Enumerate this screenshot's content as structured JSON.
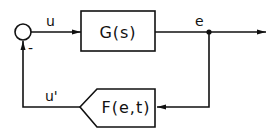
{
  "diagram": {
    "type": "feedback-control-block-diagram",
    "summing_junction": {
      "sign": "-"
    },
    "forward_block": {
      "label": "G(s)"
    },
    "feedback_block": {
      "label": "F(e,t)"
    },
    "signals": {
      "input_to_plant": "u",
      "output": "e",
      "feedback": "u'"
    },
    "colors": {
      "stroke": "#111111",
      "background": "#ffffff"
    }
  }
}
